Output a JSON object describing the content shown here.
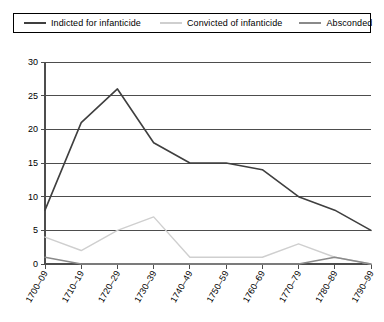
{
  "legend": {
    "position": "top",
    "items": [
      {
        "label": "Indicted for infanticide",
        "color": "#3f3f3f"
      },
      {
        "label": "Convicted of infanticide",
        "color": "#cfcfcf"
      },
      {
        "label": "Absconded",
        "color": "#8a8a8a"
      }
    ]
  },
  "chart_data": {
    "type": "line",
    "title": "",
    "subtitle": "",
    "xlabel": "",
    "ylabel": "",
    "categories": [
      "1700–09",
      "1710–19",
      "1720–29",
      "1730–39",
      "1740–49",
      "1750–59",
      "1760–69",
      "1770–79",
      "1780–89",
      "1790–99"
    ],
    "series": [
      {
        "name": "Indicted for infanticide",
        "color": "#3f3f3f",
        "values": [
          8,
          21,
          26,
          18,
          15,
          15,
          14,
          10,
          8,
          5
        ]
      },
      {
        "name": "Convicted of infanticide",
        "color": "#cfcfcf",
        "values": [
          4,
          2,
          5,
          7,
          1,
          1,
          1,
          3,
          1,
          0
        ]
      },
      {
        "name": "Absconded",
        "color": "#8a8a8a",
        "values": [
          1,
          0,
          0,
          0,
          0,
          0,
          0,
          0,
          1,
          0
        ]
      }
    ],
    "ylim": [
      0,
      30
    ],
    "yticks": [
      0,
      5,
      10,
      15,
      20,
      25,
      30
    ],
    "ytick_labels": [
      "0",
      "5",
      "10",
      "15",
      "20",
      "25",
      "30"
    ],
    "grid": true,
    "grid_axis": "y",
    "legend_position": "top"
  }
}
